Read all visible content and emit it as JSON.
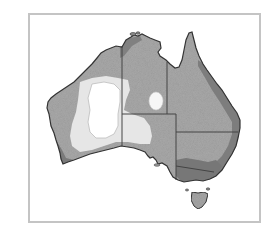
{
  "map": {
    "subject": "Australia",
    "description": "Greyscale shaded map of Australia with state borders; white/light central desert region, medium grey interior, darker coastal bands",
    "colors": {
      "frame": "#c4c4c4",
      "background": "#ffffff",
      "outline": "#333333",
      "land_medium": "#a9a9a9",
      "land_dark": "#777777",
      "land_light": "#e4e4e4",
      "land_white": "#ffffff",
      "border_line": "#444444"
    },
    "regions": [
      {
        "name": "Western Australia"
      },
      {
        "name": "Northern Territory"
      },
      {
        "name": "South Australia"
      },
      {
        "name": "Queensland"
      },
      {
        "name": "New South Wales"
      },
      {
        "name": "Victoria"
      },
      {
        "name": "Tasmania"
      }
    ],
    "shading_zones": [
      {
        "zone": "central-desert-core",
        "shade": "white"
      },
      {
        "zone": "central-desert-halo",
        "shade": "light"
      },
      {
        "zone": "nt-interior-patch",
        "shade": "white"
      },
      {
        "zone": "interior",
        "shade": "medium"
      },
      {
        "zone": "coastal-bands",
        "shade": "dark"
      }
    ]
  }
}
